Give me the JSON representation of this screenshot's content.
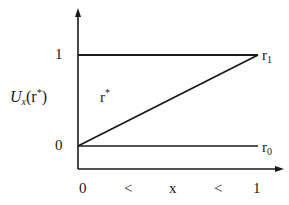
{
  "diagram": {
    "y_axis": {
      "label_main": "U",
      "label_sub": "x",
      "label_arg_open": "(r",
      "label_arg_sup": "*",
      "label_arg_close": ")",
      "ticks": [
        "1",
        "0"
      ]
    },
    "x_axis": {
      "labels": [
        "0",
        "<",
        "x",
        "<",
        "1"
      ]
    },
    "region_label": {
      "main": "r",
      "sup": "*"
    },
    "lines": [
      {
        "name": "r1",
        "label_main": "r",
        "label_sub": "1",
        "from": [
          0,
          1
        ],
        "to": [
          1,
          1
        ]
      },
      {
        "name": "r0",
        "label_main": "r",
        "label_sub": "0",
        "from": [
          0,
          0
        ],
        "to": [
          1,
          0
        ]
      },
      {
        "name": "diagonal",
        "from": [
          0,
          0
        ],
        "to": [
          1,
          1
        ]
      }
    ],
    "colors": {
      "ink": "#1a1a1a",
      "background": "#ffffff"
    }
  }
}
